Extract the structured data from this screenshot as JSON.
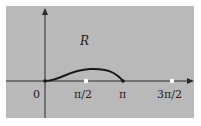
{
  "diagram": {
    "background": "#ffffff",
    "panel_color": "#b9b9b9",
    "axis_color": "#2a2a2a",
    "curve_color": "#1a1a1a",
    "region_label": "R",
    "origin_label": "0",
    "x_ticks": [
      "π/2",
      "π",
      "3π/2"
    ],
    "open_points": [
      "π/2",
      "3π/2"
    ]
  }
}
